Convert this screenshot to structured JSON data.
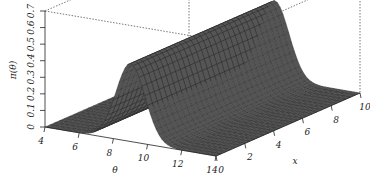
{
  "chart_data": {
    "type": "surface",
    "title": "",
    "zlabel": "π(θ)",
    "ylabel": "θ",
    "xlabel": "x",
    "zlim": [
      0,
      0.7
    ],
    "ylim": [
      4,
      14
    ],
    "xlim": [
      0,
      10
    ],
    "z_ticks": [
      "0",
      "0.1",
      "0.2",
      "0.3",
      "0.4",
      "0.5",
      "0.6",
      "0.7"
    ],
    "theta_ticks": [
      "4",
      "6",
      "8",
      "10",
      "12",
      "14"
    ],
    "x_ticks": [
      "0",
      "2",
      "4",
      "6",
      "8",
      "10"
    ],
    "surface": {
      "description": "Gaussian ridge in θ, constant along x",
      "theta_center": 9,
      "theta_sd": 0.85,
      "peak": 0.47
    },
    "grid": false,
    "box": "dotted back edges"
  },
  "colors": {
    "surface_fill": "#555555",
    "mesh_line": "#222222",
    "axis": "#222222",
    "box": "#555555"
  }
}
